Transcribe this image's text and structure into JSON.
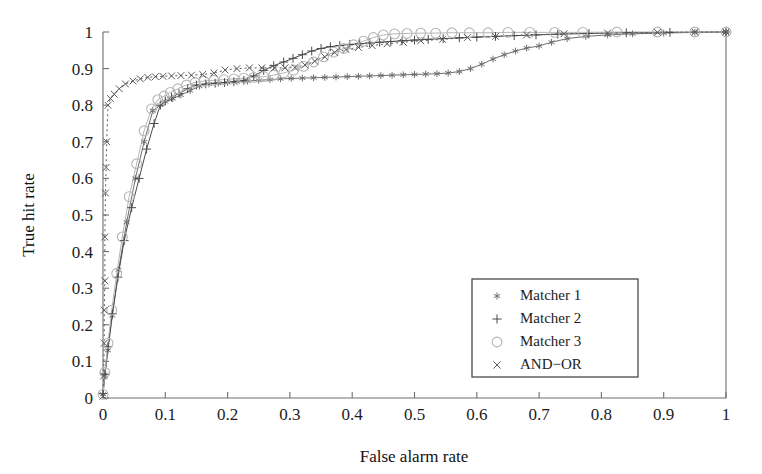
{
  "chart_data": {
    "type": "line",
    "title": "",
    "xlabel": "False alarm rate",
    "ylabel": "True hit rate",
    "xlim": [
      0,
      1
    ],
    "ylim": [
      0,
      1
    ],
    "grid": false,
    "legend_position": "lower-right",
    "x_ticks": [
      "0",
      "0.1",
      "0.2",
      "0.3",
      "0.4",
      "0.5",
      "0.6",
      "0.7",
      "0.8",
      "0.9",
      "1"
    ],
    "x_tick_values": [
      0,
      0.1,
      0.2,
      0.3,
      0.4,
      0.5,
      0.6,
      0.7,
      0.8,
      0.9,
      1
    ],
    "y_ticks": [
      "0",
      "0.1",
      "0.2",
      "0.3",
      "0.4",
      "0.5",
      "0.6",
      "0.7",
      "0.8",
      "0.9",
      "1"
    ],
    "y_tick_values": [
      0,
      0.1,
      0.2,
      0.3,
      0.4,
      0.5,
      0.6,
      0.7,
      0.8,
      0.9,
      1
    ],
    "series": [
      {
        "name": "Matcher 1",
        "marker": "asterisk",
        "color": "#6e6e6e",
        "linestyle": "solid",
        "x": [
          0.0,
          0.003,
          0.008,
          0.015,
          0.025,
          0.038,
          0.052,
          0.066,
          0.08,
          0.092,
          0.1,
          0.112,
          0.125,
          0.14,
          0.155,
          0.17,
          0.185,
          0.2,
          0.215,
          0.232,
          0.25,
          0.268,
          0.285,
          0.302,
          0.32,
          0.338,
          0.356,
          0.374,
          0.392,
          0.41,
          0.428,
          0.446,
          0.464,
          0.482,
          0.5,
          0.518,
          0.536,
          0.554,
          0.572,
          0.59,
          0.608,
          0.626,
          0.644,
          0.662,
          0.68,
          0.7,
          0.72,
          0.745,
          0.775,
          0.81,
          0.85,
          0.9,
          0.95,
          1.0
        ],
        "y": [
          0.01,
          0.06,
          0.13,
          0.225,
          0.35,
          0.48,
          0.6,
          0.7,
          0.785,
          0.8,
          0.81,
          0.818,
          0.828,
          0.84,
          0.852,
          0.858,
          0.86,
          0.862,
          0.864,
          0.866,
          0.868,
          0.87,
          0.872,
          0.873,
          0.874,
          0.875,
          0.876,
          0.877,
          0.878,
          0.879,
          0.88,
          0.881,
          0.882,
          0.883,
          0.884,
          0.885,
          0.886,
          0.888,
          0.892,
          0.9,
          0.912,
          0.926,
          0.938,
          0.948,
          0.956,
          0.962,
          0.972,
          0.982,
          0.988,
          0.992,
          0.995,
          0.997,
          0.999,
          1.0
        ]
      },
      {
        "name": "Matcher 2",
        "marker": "plus",
        "color": "#4a4a4a",
        "linestyle": "solid",
        "x": [
          0.0,
          0.003,
          0.008,
          0.015,
          0.024,
          0.034,
          0.046,
          0.058,
          0.07,
          0.082,
          0.092,
          0.1,
          0.11,
          0.122,
          0.136,
          0.15,
          0.165,
          0.18,
          0.195,
          0.21,
          0.226,
          0.242,
          0.258,
          0.274,
          0.29,
          0.305,
          0.32,
          0.335,
          0.35,
          0.365,
          0.38,
          0.396,
          0.412,
          0.428,
          0.444,
          0.462,
          0.48,
          0.5,
          0.522,
          0.546,
          0.572,
          0.6,
          0.63,
          0.66,
          0.695,
          0.73,
          0.78,
          0.84,
          0.91,
          1.0
        ],
        "y": [
          0.012,
          0.065,
          0.14,
          0.23,
          0.33,
          0.43,
          0.52,
          0.6,
          0.68,
          0.75,
          0.8,
          0.812,
          0.822,
          0.832,
          0.845,
          0.855,
          0.858,
          0.86,
          0.862,
          0.864,
          0.868,
          0.88,
          0.895,
          0.908,
          0.918,
          0.928,
          0.938,
          0.948,
          0.955,
          0.96,
          0.963,
          0.966,
          0.968,
          0.97,
          0.972,
          0.974,
          0.976,
          0.978,
          0.98,
          0.982,
          0.984,
          0.986,
          0.988,
          0.99,
          0.992,
          0.994,
          0.996,
          0.998,
          0.999,
          1.0
        ]
      },
      {
        "name": "Matcher 3",
        "marker": "circle",
        "color": "#b5b5b5",
        "linestyle": "solid",
        "x": [
          0.0,
          0.003,
          0.008,
          0.014,
          0.022,
          0.031,
          0.042,
          0.054,
          0.066,
          0.078,
          0.088,
          0.098,
          0.108,
          0.12,
          0.134,
          0.148,
          0.162,
          0.178,
          0.194,
          0.21,
          0.226,
          0.242,
          0.258,
          0.274,
          0.29,
          0.306,
          0.322,
          0.338,
          0.354,
          0.37,
          0.386,
          0.402,
          0.418,
          0.434,
          0.45,
          0.468,
          0.488,
          0.51,
          0.534,
          0.56,
          0.588,
          0.618,
          0.65,
          0.685,
          0.725,
          0.77,
          0.825,
          0.89,
          0.95,
          1.0
        ],
        "y": [
          0.01,
          0.07,
          0.15,
          0.24,
          0.34,
          0.44,
          0.55,
          0.64,
          0.73,
          0.79,
          0.815,
          0.825,
          0.835,
          0.845,
          0.855,
          0.862,
          0.866,
          0.868,
          0.87,
          0.872,
          0.874,
          0.876,
          0.878,
          0.882,
          0.888,
          0.896,
          0.906,
          0.918,
          0.932,
          0.945,
          0.955,
          0.965,
          0.975,
          0.985,
          0.992,
          0.995,
          0.996,
          0.997,
          0.997,
          0.998,
          0.998,
          0.998,
          0.999,
          0.999,
          0.999,
          0.999,
          1.0,
          1.0,
          1.0,
          1.0
        ]
      },
      {
        "name": "AND−OR",
        "marker": "x",
        "color": "#5a5a5a",
        "linestyle": "dotted",
        "x": [
          0.0,
          0.001,
          0.002,
          0.002,
          0.003,
          0.003,
          0.004,
          0.005,
          0.006,
          0.008,
          0.012,
          0.018,
          0.026,
          0.036,
          0.048,
          0.06,
          0.072,
          0.084,
          0.096,
          0.11,
          0.125,
          0.142,
          0.16,
          0.178,
          0.196,
          0.215,
          0.235,
          0.255,
          0.275,
          0.292,
          0.308,
          0.324,
          0.34,
          0.356,
          0.372,
          0.39,
          0.41,
          0.432,
          0.456,
          0.482,
          0.51,
          0.545,
          0.585,
          0.63,
          0.68,
          0.74,
          0.81,
          0.89,
          0.95,
          1.0
        ],
        "y": [
          0.005,
          0.06,
          0.15,
          0.24,
          0.32,
          0.44,
          0.56,
          0.63,
          0.7,
          0.8,
          0.818,
          0.83,
          0.845,
          0.858,
          0.866,
          0.872,
          0.876,
          0.878,
          0.879,
          0.88,
          0.881,
          0.882,
          0.884,
          0.888,
          0.896,
          0.9,
          0.902,
          0.902,
          0.902,
          0.902,
          0.903,
          0.91,
          0.92,
          0.932,
          0.944,
          0.952,
          0.958,
          0.963,
          0.968,
          0.972,
          0.976,
          0.98,
          0.985,
          0.988,
          0.992,
          0.995,
          0.997,
          0.999,
          1.0,
          1.0
        ]
      }
    ]
  },
  "legend": {
    "entries": [
      {
        "label": "Matcher 1",
        "marker": "asterisk-marker-icon"
      },
      {
        "label": "Matcher 2",
        "marker": "plus-marker-icon"
      },
      {
        "label": "Matcher 3",
        "marker": "circle-marker-icon"
      },
      {
        "label": "AND−OR",
        "marker": "x-marker-icon"
      }
    ]
  },
  "colors": {
    "axis": "#6f6f6f",
    "text": "#1c1c1c",
    "background": "#ffffff",
    "legend_border": "#4a4a4a"
  }
}
